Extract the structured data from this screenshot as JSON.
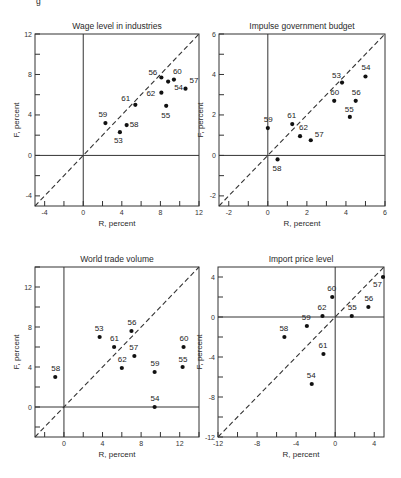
{
  "figure": {
    "header_fragment": "g"
  },
  "chart_data": [
    {
      "type": "scatter",
      "title": "Wage level in industries",
      "xlabel": "R, percent",
      "ylabel": "F, percent",
      "xlim": [
        -5,
        12
      ],
      "ylim": [
        -5,
        12
      ],
      "xticks": [
        -4,
        0,
        4,
        8,
        12
      ],
      "yticks": [
        -4,
        0,
        4,
        8,
        12
      ],
      "minor_step": 2,
      "diagonal": "y = x (dashed)",
      "frame": {
        "x0": 35,
        "y0": 34,
        "x1": 199,
        "y1": 206
      },
      "points": [
        {
          "label": "53",
          "x": 3.8,
          "y": 2.3,
          "lx": -6,
          "ly": 11
        },
        {
          "label": "54",
          "x": 8.8,
          "y": 7.3,
          "lx": 6,
          "ly": 8
        },
        {
          "label": "55",
          "x": 8.6,
          "y": 4.9,
          "lx": -5,
          "ly": 12
        },
        {
          "label": "56",
          "x": 8.1,
          "y": 7.7,
          "lx": -13,
          "ly": -3
        },
        {
          "label": "57",
          "x": 10.6,
          "y": 6.6,
          "lx": 4,
          "ly": -6
        },
        {
          "label": "58",
          "x": 4.5,
          "y": 3.0,
          "lx": 3,
          "ly": 2
        },
        {
          "label": "59",
          "x": 2.3,
          "y": 3.2,
          "lx": -7,
          "ly": -6
        },
        {
          "label": "60",
          "x": 9.4,
          "y": 7.5,
          "lx": -1,
          "ly": -6
        },
        {
          "label": "61",
          "x": 5.4,
          "y": 5.0,
          "lx": -14,
          "ly": -4
        },
        {
          "label": "62",
          "x": 8.1,
          "y": 6.2,
          "lx": -15,
          "ly": 3
        }
      ]
    },
    {
      "type": "scatter",
      "title": "Impulse government budget",
      "xlabel": "R, percent",
      "ylabel": "F, percent",
      "xlim": [
        -2.5,
        6
      ],
      "ylim": [
        -2.5,
        6
      ],
      "xticks": [
        -2,
        0,
        2,
        4,
        6
      ],
      "yticks": [
        -2,
        0,
        2,
        4,
        6
      ],
      "minor_step": 1,
      "diagonal": "y = x (dashed)",
      "frame": {
        "x0": 219,
        "y0": 34,
        "x1": 385,
        "y1": 206
      },
      "points": [
        {
          "label": "53",
          "x": 3.8,
          "y": 3.6,
          "lx": -10,
          "ly": -5
        },
        {
          "label": "54",
          "x": 5.0,
          "y": 3.9,
          "lx": -4,
          "ly": -6
        },
        {
          "label": "55",
          "x": 4.2,
          "y": 1.9,
          "lx": -5,
          "ly": -5
        },
        {
          "label": "56",
          "x": 4.5,
          "y": 2.7,
          "lx": -4,
          "ly": -6
        },
        {
          "label": "57",
          "x": 2.2,
          "y": 0.75,
          "lx": 4,
          "ly": -3
        },
        {
          "label": "58",
          "x": 0.5,
          "y": -0.2,
          "lx": -5,
          "ly": 12
        },
        {
          "label": "59",
          "x": 0.0,
          "y": 1.35,
          "lx": -4,
          "ly": -6
        },
        {
          "label": "60",
          "x": 3.4,
          "y": 2.7,
          "lx": -4,
          "ly": -6
        },
        {
          "label": "61",
          "x": 1.25,
          "y": 1.55,
          "lx": -5,
          "ly": -6
        },
        {
          "label": "62",
          "x": 1.65,
          "y": 0.95,
          "lx": -1,
          "ly": -6
        }
      ]
    },
    {
      "type": "scatter",
      "title": "World trade volume",
      "xlabel": "R, percent",
      "ylabel": "F, percent",
      "xlim": [
        -3,
        14
      ],
      "ylim": [
        -3,
        14
      ],
      "xticks": [
        0,
        4,
        8,
        12
      ],
      "yticks": [
        0,
        4,
        8,
        12
      ],
      "minor_step": 2,
      "diagonal": "y = x (dashed)",
      "frame": {
        "x0": 35,
        "y0": 267,
        "x1": 199,
        "y1": 437
      },
      "points": [
        {
          "label": "53",
          "x": 3.7,
          "y": 7.0,
          "lx": -5,
          "ly": -6
        },
        {
          "label": "54",
          "x": 9.4,
          "y": 0.0,
          "lx": -4,
          "ly": -6
        },
        {
          "label": "55",
          "x": 12.3,
          "y": 4.0,
          "lx": -4,
          "ly": -5
        },
        {
          "label": "56",
          "x": 7.0,
          "y": 7.6,
          "lx": -4,
          "ly": -6
        },
        {
          "label": "57",
          "x": 7.3,
          "y": 5.1,
          "lx": -5,
          "ly": -6
        },
        {
          "label": "58",
          "x": -0.9,
          "y": 3.0,
          "lx": -4,
          "ly": -6
        },
        {
          "label": "59",
          "x": 9.4,
          "y": 3.5,
          "lx": -4,
          "ly": -6
        },
        {
          "label": "60",
          "x": 12.4,
          "y": 6.0,
          "lx": -4,
          "ly": -6
        },
        {
          "label": "61",
          "x": 5.2,
          "y": 6.0,
          "lx": -4,
          "ly": -6
        },
        {
          "label": "62",
          "x": 6.0,
          "y": 3.9,
          "lx": -4,
          "ly": -6
        }
      ]
    },
    {
      "type": "scatter",
      "title": "Import price level",
      "xlabel": "R, percent",
      "ylabel": "F, percent",
      "xlim": [
        -12,
        5
      ],
      "ylim": [
        -12,
        5
      ],
      "xticks": [
        -12,
        -8,
        -4,
        0,
        4
      ],
      "yticks": [
        -12,
        -8,
        -4,
        0,
        4
      ],
      "minor_step": 2,
      "diagonal": "y = x (dashed)",
      "frame": {
        "x0": 218,
        "y0": 267,
        "x1": 384,
        "y1": 437
      },
      "points": [
        {
          "label": "54",
          "x": -2.4,
          "y": -6.7,
          "lx": -5,
          "ly": -6
        },
        {
          "label": "55",
          "x": 1.7,
          "y": 0.1,
          "lx": -4,
          "ly": -6
        },
        {
          "label": "56",
          "x": 3.4,
          "y": 1.0,
          "lx": -4,
          "ly": -6
        },
        {
          "label": "57",
          "x": 4.9,
          "y": 4.0,
          "lx": -10,
          "ly": 10
        },
        {
          "label": "58",
          "x": -5.2,
          "y": -2.0,
          "lx": -5,
          "ly": -6
        },
        {
          "label": "59",
          "x": -2.9,
          "y": -0.9,
          "lx": -5,
          "ly": -6
        },
        {
          "label": "60",
          "x": -0.3,
          "y": 2.0,
          "lx": -5,
          "ly": -6
        },
        {
          "label": "61",
          "x": -1.2,
          "y": -3.7,
          "lx": -5,
          "ly": -6
        },
        {
          "label": "62",
          "x": -1.3,
          "y": 0.1,
          "lx": -5,
          "ly": -6
        }
      ]
    }
  ]
}
